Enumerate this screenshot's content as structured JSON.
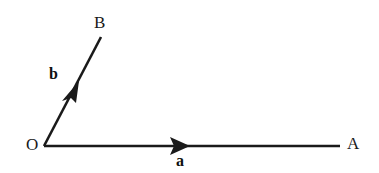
{
  "figure": {
    "background_color": "#ffffff",
    "stroke_color": "#1a1a1a",
    "points": {
      "origin": {
        "label": "O",
        "x": 44,
        "y": 146
      },
      "end_a": {
        "label": "A",
        "x": 340,
        "y": 146
      },
      "end_b": {
        "label": "B",
        "x": 101,
        "y": 37
      }
    },
    "vectors": [
      {
        "name": "a",
        "label": "a",
        "from": "O",
        "to": "A",
        "x1": 44,
        "y1": 146,
        "x2": 340,
        "y2": 146,
        "arrow_at_x": 181,
        "arrow_at_y": 146,
        "stroke_width": 2.6
      },
      {
        "name": "b",
        "label": "b",
        "from": "O",
        "to": "B",
        "x1": 44,
        "y1": 146,
        "x2": 101,
        "y2": 37,
        "arrow_at_x": 71,
        "arrow_at_y": 94,
        "stroke_width": 2.6
      }
    ],
    "labels": {
      "point_O": "O",
      "point_A": "A",
      "point_B": "B",
      "vector_a": "a",
      "vector_b": "b"
    }
  }
}
